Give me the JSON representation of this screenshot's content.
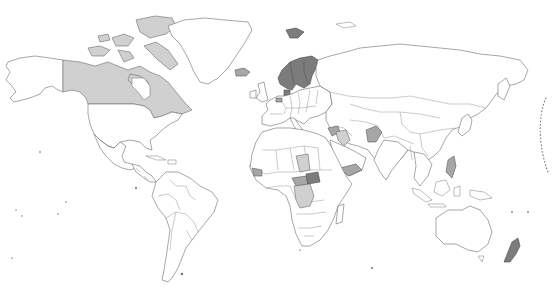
{
  "map": {
    "type": "choropleth",
    "projection": "equirectangular-like (Robinson style)",
    "background": "#ffffff",
    "border_color": "#6b6b6b",
    "legend": null,
    "title": null,
    "shades": {
      "none": "#ffffff",
      "light": "#d0d0d0",
      "medium": "#a6a6a6",
      "dark": "#7c7c7c"
    },
    "highlighted_regions": [
      {
        "name": "Canada",
        "shade": "light"
      },
      {
        "name": "Canadian Arctic Archipelago",
        "shade": "light"
      },
      {
        "name": "Iceland",
        "shade": "medium"
      },
      {
        "name": "Norway",
        "shade": "dark"
      },
      {
        "name": "Sweden",
        "shade": "dark"
      },
      {
        "name": "Finland",
        "shade": "dark"
      },
      {
        "name": "Svalbard",
        "shade": "dark"
      },
      {
        "name": "Denmark",
        "shade": "dark"
      },
      {
        "name": "Netherlands",
        "shade": "medium"
      },
      {
        "name": "Syria",
        "shade": "medium"
      },
      {
        "name": "Iraq",
        "shade": "light"
      },
      {
        "name": "Afghanistan",
        "shade": "medium"
      },
      {
        "name": "Yemen",
        "shade": "medium"
      },
      {
        "name": "Chad",
        "shade": "light"
      },
      {
        "name": "Central African Republic",
        "shade": "medium"
      },
      {
        "name": "South Sudan",
        "shade": "dark"
      },
      {
        "name": "DR Congo",
        "shade": "light"
      },
      {
        "name": "Sierra Leone / Liberia",
        "shade": "medium"
      },
      {
        "name": "Philippines",
        "shade": "medium"
      },
      {
        "name": "New Zealand",
        "shade": "dark"
      }
    ],
    "annotations": [
      {
        "type": "dotted-arc",
        "location": "right edge, Pacific",
        "description": "dotted date-line style curve"
      }
    ]
  }
}
